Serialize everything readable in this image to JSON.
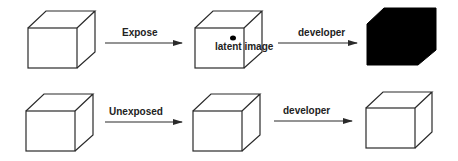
{
  "diagram": {
    "rows": [
      {
        "name": "exposed",
        "step1_label": "Expose",
        "mid_annotation": "latent image",
        "step2_label": "developer",
        "result": "black cube"
      },
      {
        "name": "unexposed",
        "step1_label": "Unexposed",
        "step2_label": "developer",
        "result": "white cube"
      }
    ],
    "colors": {
      "stroke": "#2a2a2a",
      "developed": "#000000",
      "background": "#ffffff"
    }
  }
}
